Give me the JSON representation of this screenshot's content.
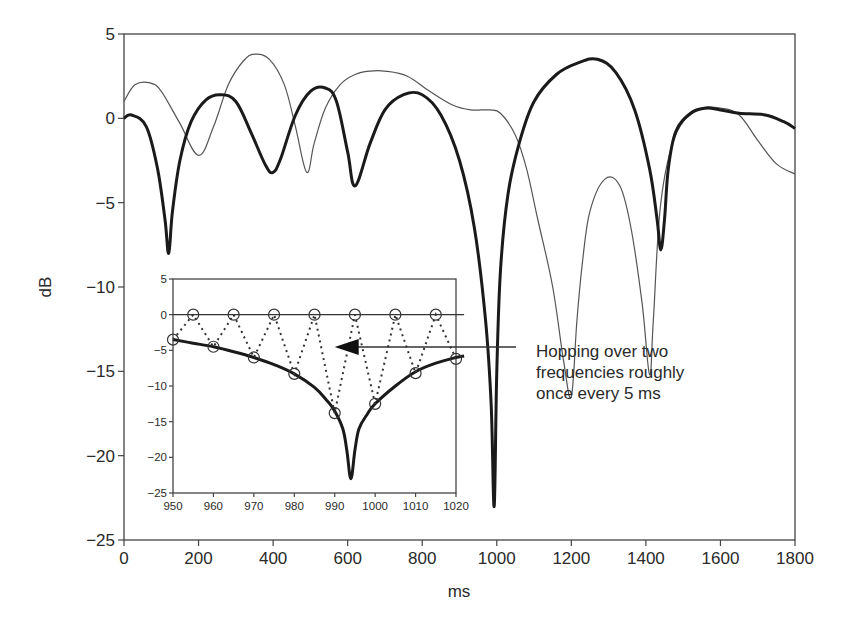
{
  "chart_data": [
    {
      "id": "main",
      "type": "line",
      "title": "",
      "xlabel": "ms",
      "ylabel": "dB",
      "xlim": [
        0,
        1800
      ],
      "ylim": [
        -25,
        5
      ],
      "xticks": [
        0,
        200,
        400,
        600,
        800,
        1000,
        1200,
        1400,
        1600,
        1800
      ],
      "yticks": [
        5,
        0,
        -5,
        -10,
        -15,
        -20,
        -25
      ],
      "xtick_labels": [
        "0",
        "200",
        "400",
        "600",
        "800",
        "1000",
        "1200",
        "1400",
        "1600",
        "1800"
      ],
      "ytick_labels": [
        "5",
        "0",
        "−5",
        "−10",
        "−15",
        "−20",
        "−25"
      ],
      "grid": false,
      "legend": null,
      "series": [
        {
          "name": "thin",
          "style": "thin solid",
          "color": "#555555",
          "x": [
            0,
            30,
            70,
            100,
            150,
            200,
            240,
            280,
            320,
            350,
            390,
            430,
            460,
            490,
            510,
            540,
            580,
            620,
            660,
            700,
            760,
            820,
            880,
            930,
            980,
            1010,
            1050,
            1080,
            1110,
            1150,
            1180,
            1200,
            1215,
            1230,
            1250,
            1290,
            1330,
            1360,
            1390,
            1410,
            1420,
            1440,
            1480,
            1540,
            1600,
            1650,
            1700,
            1750,
            1800
          ],
          "y": [
            1,
            2,
            2.1,
            1.6,
            -0.3,
            -2.2,
            -0.5,
            2.0,
            3.4,
            3.8,
            3.5,
            2.0,
            -0.5,
            -3.2,
            -1.5,
            0.6,
            2.0,
            2.6,
            2.8,
            2.8,
            2.5,
            1.6,
            0.8,
            0.5,
            0.5,
            0.3,
            -1.0,
            -3.0,
            -6.0,
            -10.0,
            -14.5,
            -16.5,
            -12.0,
            -8.5,
            -5.5,
            -3.6,
            -4.0,
            -6.5,
            -11.0,
            -15.2,
            -12.0,
            -5.0,
            -1.0,
            0.5,
            0.6,
            0.2,
            -1.3,
            -2.7,
            -3.3
          ]
        },
        {
          "name": "thick",
          "style": "thick solid",
          "color": "#1a1a1a",
          "x": [
            0,
            20,
            60,
            90,
            110,
            120,
            130,
            150,
            180,
            220,
            260,
            300,
            340,
            380,
            400,
            420,
            460,
            500,
            540,
            570,
            600,
            620,
            660,
            700,
            750,
            800,
            850,
            900,
            940,
            970,
            985,
            993,
            1000,
            1010,
            1030,
            1060,
            1100,
            1160,
            1220,
            1270,
            1320,
            1370,
            1410,
            1430,
            1440,
            1450,
            1460,
            1480,
            1520,
            1560,
            1600,
            1650,
            1720,
            1770,
            1800
          ],
          "y": [
            0,
            0.2,
            -0.5,
            -3.0,
            -6.0,
            -8.0,
            -5.5,
            -2.5,
            -0.2,
            1.1,
            1.4,
            1.0,
            -0.8,
            -2.8,
            -3.2,
            -2.4,
            0.2,
            1.6,
            1.8,
            1.0,
            -2.0,
            -4.0,
            -1.5,
            0.5,
            1.4,
            1.4,
            0.2,
            -2.5,
            -6.5,
            -12.0,
            -17.0,
            -23.0,
            -15.0,
            -9.0,
            -4.5,
            -1.5,
            1.0,
            2.6,
            3.3,
            3.5,
            2.7,
            0.5,
            -3.0,
            -6.0,
            -7.8,
            -6.0,
            -3.0,
            -0.8,
            0.3,
            0.6,
            0.5,
            0.3,
            0.2,
            -0.2,
            -0.6
          ]
        }
      ]
    },
    {
      "id": "inset",
      "type": "line",
      "title": "",
      "xlabel": "",
      "ylabel": "",
      "xlim": [
        950,
        1020
      ],
      "ylim": [
        -25,
        5
      ],
      "xticks": [
        950,
        960,
        970,
        980,
        990,
        1000,
        1010,
        1020
      ],
      "yticks": [
        5,
        0,
        -5,
        -10,
        -15,
        -20,
        -25
      ],
      "xtick_labels": [
        "950",
        "960",
        "970",
        "980",
        "990",
        "1000",
        "1010",
        "1020"
      ],
      "ytick_labels": [
        "5",
        "0",
        "−5",
        "−10",
        "−15",
        "−20",
        "−25"
      ],
      "grid": false,
      "series": [
        {
          "name": "flat reference (0 dB)",
          "style": "thin solid",
          "color": "#333333",
          "x": [
            950,
            1022
          ],
          "y": [
            0,
            0
          ]
        },
        {
          "name": "envelope",
          "style": "thick solid",
          "color": "#1a1a1a",
          "x": [
            950,
            955,
            960,
            965,
            970,
            975,
            980,
            985,
            988,
            990,
            992,
            993,
            994,
            995,
            996,
            998,
            1000,
            1005,
            1010,
            1015,
            1020,
            1022
          ],
          "y": [
            -3.5,
            -4.0,
            -4.5,
            -5.2,
            -6.0,
            -7.0,
            -8.3,
            -10.2,
            -12.0,
            -13.5,
            -16.0,
            -19.0,
            -23.0,
            -19.0,
            -16.0,
            -14.0,
            -12.5,
            -10.0,
            -8.0,
            -6.8,
            -6.0,
            -5.8
          ]
        },
        {
          "name": "hopping samples",
          "style": "dotted with circle markers",
          "color": "#333333",
          "x": [
            950,
            955,
            960,
            965,
            970,
            975,
            980,
            985,
            990,
            995,
            1000,
            1005,
            1010,
            1015,
            1020
          ],
          "y": [
            -3.5,
            0,
            -4.5,
            0,
            -6.0,
            0,
            -8.3,
            0,
            -13.8,
            0,
            -12.5,
            0,
            -8.2,
            0,
            -6.2
          ]
        }
      ]
    }
  ],
  "annotation": {
    "lines": [
      "Hopping over two",
      "frequencies roughly",
      "once every 5 ms"
    ],
    "arrow_target": {
      "x_ms": 990,
      "y_db": -4.6
    }
  },
  "labels": {
    "xlabel": "ms",
    "ylabel": "dB"
  }
}
